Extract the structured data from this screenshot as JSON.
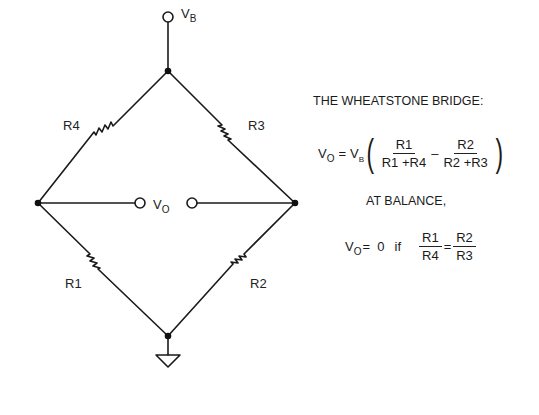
{
  "diagram": {
    "title": "THE WHEATSTONE BRIDGE:",
    "supply": {
      "symbol": "V",
      "subscript": "B"
    },
    "output": {
      "symbol": "V",
      "subscript": "O"
    },
    "resistors": [
      {
        "id": "R1",
        "label": "R1",
        "arm": "lower-left"
      },
      {
        "id": "R2",
        "label": "R2",
        "arm": "lower-right"
      },
      {
        "id": "R3",
        "label": "R3",
        "arm": "upper-right"
      },
      {
        "id": "R4",
        "label": "R4",
        "arm": "upper-left"
      }
    ],
    "ground": "ground-symbol",
    "equation": {
      "lhs_symbol": "V",
      "lhs_sub": "O",
      "equals": "=",
      "vb_symbol": "V",
      "vb_sub": "B",
      "frac1_num": "R1",
      "frac1_den": "R1 +R4",
      "minus": "–",
      "frac2_num": "R2",
      "frac2_den": "R2 +R3",
      "open_paren": "(",
      "close_paren": ")"
    },
    "balance_heading": "AT BALANCE,",
    "balance": {
      "lhs_symbol": "V",
      "lhs_sub": "O",
      "equals_zero": "=  0",
      "if_text": "if",
      "left_num": "R1",
      "left_den": "R4",
      "eq": "=",
      "right_num": "R2",
      "right_den": "R3"
    }
  }
}
